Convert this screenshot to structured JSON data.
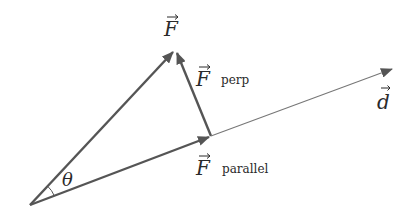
{
  "diagram": {
    "colors": {
      "arrow": "#555555",
      "text": "#2a2a2a",
      "background": "#ffffff"
    },
    "origin": {
      "x": 30,
      "y": 205
    },
    "vectors": [
      {
        "id": "F",
        "label": "F",
        "subscript": "",
        "from": [
          30,
          205
        ],
        "to": [
          175,
          50
        ]
      },
      {
        "id": "F_perp",
        "label": "F",
        "subscript": "perp",
        "from": [
          211,
          136
        ],
        "to": [
          175,
          50
        ]
      },
      {
        "id": "F_parallel",
        "label": "F",
        "subscript": "parallel",
        "from": [
          30,
          205
        ],
        "to": [
          211,
          136
        ]
      },
      {
        "id": "d",
        "label": "d",
        "subscript": "",
        "from": [
          211,
          136
        ],
        "to": [
          394,
          68
        ]
      }
    ],
    "labels": {
      "F": "F",
      "F_perp_main": "F",
      "F_perp_sub": "perp",
      "F_parallel_main": "F",
      "F_parallel_sub": "parallel",
      "d": "d",
      "theta": "θ"
    }
  }
}
